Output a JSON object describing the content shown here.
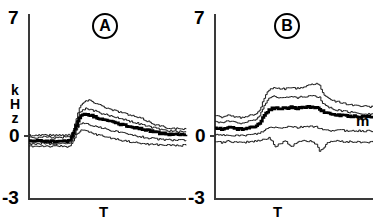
{
  "figure": {
    "panels": [
      {
        "id": "A",
        "marker_label": "A",
        "xlabel": "T",
        "ylabel": "kHz",
        "ylabel_chars": [
          "k",
          "H",
          "z"
        ],
        "yticks": [
          "7",
          "0",
          "-3"
        ]
      },
      {
        "id": "B",
        "marker_label": "B",
        "xlabel": "T",
        "ylabel": "",
        "ylabel_chars": [],
        "yticks": [
          "7",
          "0",
          "-3"
        ],
        "trace_label": "m"
      }
    ]
  },
  "chart_data": [
    {
      "type": "line",
      "title": "A",
      "xlabel": "T",
      "ylabel": "kHz",
      "ylim": [
        -3,
        7
      ],
      "yticks": [
        7,
        0,
        -3
      ],
      "xlim": [
        0,
        100
      ],
      "grid": false,
      "legend": "none",
      "series": [
        {
          "name": "upper-outer",
          "style": "thin",
          "x": [
            0,
            4,
            8,
            12,
            16,
            20,
            24,
            26,
            28,
            30,
            32,
            34,
            36,
            38,
            40,
            44,
            48,
            52,
            56,
            60,
            64,
            68,
            72,
            76,
            80,
            84,
            88,
            92,
            96,
            100
          ],
          "values": [
            0.42,
            0.4,
            0.44,
            0.42,
            0.4,
            0.43,
            0.41,
            0.45,
            0.7,
            1.35,
            1.9,
            2.15,
            2.28,
            2.3,
            2.25,
            2.1,
            1.95,
            1.8,
            1.72,
            1.62,
            1.5,
            1.4,
            1.3,
            1.15,
            1.0,
            0.9,
            0.82,
            0.78,
            0.75,
            0.74
          ]
        },
        {
          "name": "upper-inner",
          "style": "thin",
          "x": [
            0,
            4,
            8,
            12,
            16,
            20,
            24,
            26,
            28,
            30,
            32,
            34,
            36,
            38,
            40,
            44,
            48,
            52,
            56,
            60,
            64,
            68,
            72,
            76,
            80,
            84,
            88,
            92,
            96,
            100
          ],
          "values": [
            0.3,
            0.28,
            0.32,
            0.3,
            0.29,
            0.31,
            0.3,
            0.34,
            0.6,
            1.15,
            1.62,
            1.8,
            1.86,
            1.84,
            1.78,
            1.65,
            1.55,
            1.45,
            1.38,
            1.28,
            1.18,
            1.08,
            0.98,
            0.88,
            0.8,
            0.72,
            0.66,
            0.62,
            0.6,
            0.58
          ]
        },
        {
          "name": "mean",
          "style": "bold",
          "x": [
            0,
            4,
            8,
            12,
            16,
            20,
            24,
            26,
            28,
            30,
            32,
            34,
            36,
            38,
            40,
            44,
            48,
            52,
            56,
            60,
            64,
            68,
            72,
            76,
            80,
            84,
            88,
            92,
            96,
            100
          ],
          "values": [
            0.1,
            0.08,
            0.12,
            0.09,
            0.07,
            0.1,
            0.08,
            0.18,
            0.48,
            0.98,
            1.38,
            1.52,
            1.56,
            1.52,
            1.46,
            1.34,
            1.24,
            1.14,
            1.06,
            0.98,
            0.9,
            0.82,
            0.74,
            0.66,
            0.58,
            0.52,
            0.48,
            0.46,
            0.44,
            0.44
          ]
        },
        {
          "name": "lower-inner",
          "style": "thin",
          "x": [
            0,
            4,
            8,
            12,
            16,
            20,
            24,
            26,
            28,
            30,
            32,
            34,
            36,
            38,
            40,
            44,
            48,
            52,
            56,
            60,
            64,
            68,
            72,
            76,
            80,
            84,
            88,
            92,
            96,
            100
          ],
          "values": [
            -0.05,
            -0.06,
            -0.03,
            -0.05,
            -0.07,
            -0.04,
            -0.06,
            0.02,
            0.28,
            0.7,
            1.0,
            1.08,
            1.06,
            1.0,
            0.94,
            0.84,
            0.76,
            0.68,
            0.6,
            0.52,
            0.44,
            0.38,
            0.32,
            0.26,
            0.22,
            0.18,
            0.16,
            0.15,
            0.14,
            0.14
          ]
        },
        {
          "name": "lower-outer",
          "style": "thin",
          "x": [
            0,
            4,
            8,
            12,
            16,
            20,
            24,
            26,
            28,
            30,
            32,
            34,
            36,
            38,
            40,
            44,
            48,
            52,
            56,
            60,
            64,
            68,
            72,
            76,
            80,
            84,
            88,
            92,
            96,
            100
          ],
          "values": [
            -0.18,
            -0.2,
            -0.17,
            -0.19,
            -0.21,
            -0.18,
            -0.2,
            -0.14,
            0.08,
            0.42,
            0.64,
            0.68,
            0.64,
            0.58,
            0.52,
            0.42,
            0.34,
            0.26,
            0.18,
            0.12,
            0.06,
            0.0,
            -0.04,
            -0.08,
            -0.1,
            -0.12,
            -0.13,
            -0.14,
            -0.14,
            -0.14
          ]
        }
      ]
    },
    {
      "type": "line",
      "title": "B",
      "xlabel": "T",
      "ylabel": "",
      "ylim": [
        -3,
        7
      ],
      "yticks": [
        7,
        0,
        -3
      ],
      "xlim": [
        0,
        100
      ],
      "grid": false,
      "legend": "none",
      "annotations": [
        {
          "text": "m",
          "series": "mean",
          "position": "right"
        }
      ],
      "series": [
        {
          "name": "upper-outer",
          "style": "thin",
          "x": [
            0,
            4,
            8,
            12,
            16,
            20,
            24,
            28,
            30,
            32,
            34,
            36,
            38,
            40,
            44,
            48,
            52,
            56,
            60,
            64,
            66,
            68,
            72,
            76,
            80,
            84,
            88,
            92,
            96,
            100
          ],
          "values": [
            1.45,
            1.4,
            1.48,
            1.42,
            1.38,
            1.45,
            1.5,
            1.75,
            2.2,
            2.6,
            2.85,
            2.95,
            3.0,
            2.95,
            2.92,
            3.0,
            2.95,
            3.05,
            3.18,
            3.2,
            3.1,
            2.7,
            2.4,
            2.25,
            2.18,
            2.1,
            2.05,
            2.0,
            1.98,
            1.95
          ]
        },
        {
          "name": "upper-inner",
          "style": "thin",
          "x": [
            0,
            4,
            8,
            12,
            16,
            20,
            24,
            28,
            30,
            32,
            34,
            36,
            38,
            40,
            44,
            48,
            52,
            56,
            60,
            64,
            66,
            68,
            72,
            76,
            80,
            84,
            88,
            92,
            96,
            100
          ],
          "values": [
            1.15,
            1.1,
            1.18,
            1.12,
            1.08,
            1.14,
            1.2,
            1.45,
            1.85,
            2.2,
            2.42,
            2.5,
            2.52,
            2.48,
            2.46,
            2.5,
            2.46,
            2.5,
            2.55,
            2.52,
            2.45,
            2.15,
            1.92,
            1.8,
            1.74,
            1.68,
            1.64,
            1.6,
            1.58,
            1.56
          ]
        },
        {
          "name": "mean",
          "style": "bold",
          "x": [
            0,
            4,
            8,
            12,
            16,
            20,
            24,
            28,
            30,
            32,
            34,
            36,
            38,
            40,
            44,
            48,
            52,
            56,
            60,
            64,
            66,
            68,
            72,
            76,
            80,
            84,
            88,
            92,
            96,
            100
          ],
          "values": [
            0.8,
            0.76,
            0.84,
            0.78,
            0.74,
            0.8,
            0.86,
            1.05,
            1.35,
            1.62,
            1.8,
            1.86,
            1.9,
            1.86,
            1.88,
            1.92,
            1.88,
            1.92,
            1.95,
            1.92,
            1.86,
            1.7,
            1.58,
            1.52,
            1.48,
            1.46,
            1.44,
            1.42,
            1.42,
            1.4
          ]
        },
        {
          "name": "lower-inner",
          "style": "thin",
          "x": [
            0,
            4,
            8,
            12,
            16,
            20,
            24,
            28,
            30,
            32,
            34,
            36,
            38,
            40,
            44,
            48,
            52,
            56,
            60,
            64,
            66,
            68,
            72,
            76,
            80,
            84,
            88,
            92,
            96,
            100
          ],
          "values": [
            0.42,
            0.4,
            0.44,
            0.41,
            0.38,
            0.42,
            0.45,
            0.52,
            0.62,
            0.72,
            0.82,
            0.86,
            0.84,
            0.8,
            0.86,
            0.9,
            0.82,
            0.88,
            0.92,
            0.86,
            0.8,
            0.7,
            0.66,
            0.7,
            0.68,
            0.66,
            0.66,
            0.65,
            0.64,
            0.64
          ]
        },
        {
          "name": "lower-outer",
          "style": "thin",
          "x": [
            0,
            4,
            8,
            12,
            16,
            20,
            24,
            28,
            30,
            32,
            34,
            36,
            38,
            40,
            44,
            48,
            52,
            56,
            60,
            64,
            66,
            68,
            72,
            76,
            80,
            84,
            88,
            92,
            96,
            100
          ],
          "values": [
            0.05,
            0.02,
            0.08,
            0.04,
            0.0,
            0.05,
            0.08,
            0.12,
            0.18,
            0.22,
            0.28,
            0.1,
            -0.25,
            -0.1,
            0.1,
            -0.2,
            0.05,
            0.12,
            0.08,
            -0.05,
            -0.45,
            -0.3,
            0.05,
            0.1,
            0.08,
            0.06,
            0.05,
            0.04,
            0.04,
            0.03
          ]
        }
      ]
    }
  ]
}
